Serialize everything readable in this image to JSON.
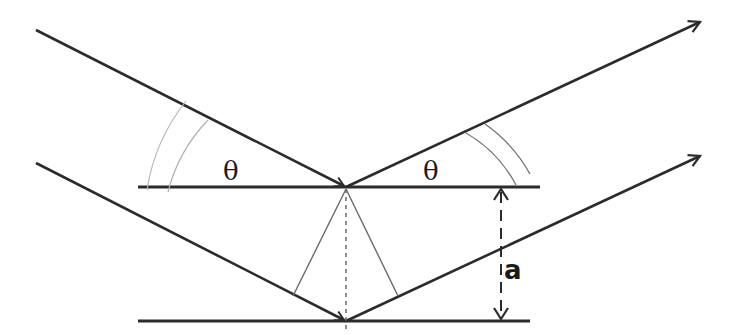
{
  "diagram": {
    "title": "",
    "labels": {
      "angle_incident": "θ",
      "angle_reflected": "θ",
      "plane_spacing": "a"
    },
    "colors": {
      "line": "#2b2b2b",
      "thin_line": "#6a6a6a",
      "arc": "#b0b0b0"
    },
    "elements": [
      {
        "type": "plane",
        "name": "upper-lattice-plane"
      },
      {
        "type": "plane",
        "name": "lower-lattice-plane"
      },
      {
        "type": "ray",
        "name": "incident-ray-1"
      },
      {
        "type": "ray",
        "name": "incident-ray-2"
      },
      {
        "type": "ray",
        "name": "reflected-ray-1"
      },
      {
        "type": "ray",
        "name": "reflected-ray-2"
      },
      {
        "type": "dimension",
        "name": "spacing-a"
      }
    ]
  }
}
